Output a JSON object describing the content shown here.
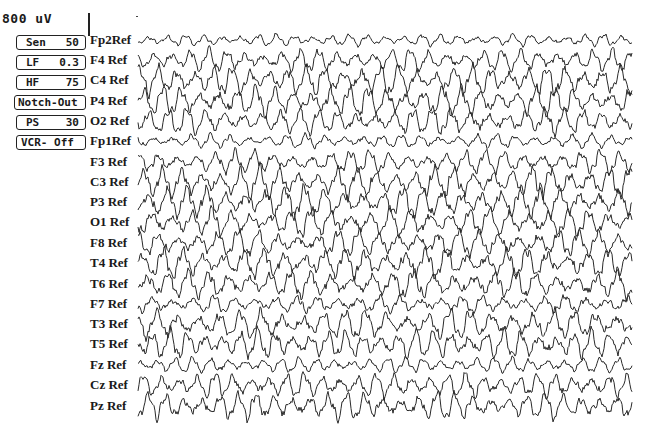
{
  "scale": {
    "label": "800 uV"
  },
  "controls": [
    {
      "id": "sen",
      "name": "Sen",
      "value": "50",
      "top": 35
    },
    {
      "id": "lf",
      "name": "LF",
      "value": "0.3",
      "top": 55
    },
    {
      "id": "hf",
      "name": "HF",
      "value": "75",
      "top": 75
    },
    {
      "id": "notch",
      "name": "Notch-Out",
      "value": "",
      "top": 95
    },
    {
      "id": "ps",
      "name": "PS",
      "value": "30",
      "top": 115
    },
    {
      "id": "vcr",
      "name": "VCR- Off",
      "value": "",
      "top": 135
    }
  ],
  "channels": [
    {
      "label": "Fp2Ref",
      "y": 40,
      "amp": 7,
      "seed": 1
    },
    {
      "label": "F4 Ref",
      "y": 60,
      "amp": 13,
      "seed": 2
    },
    {
      "label": "C4 Ref",
      "y": 80,
      "amp": 17,
      "seed": 3
    },
    {
      "label": "P4 Ref",
      "y": 101,
      "amp": 17,
      "seed": 4
    },
    {
      "label": "O2 Ref",
      "y": 121,
      "amp": 15,
      "seed": 5
    },
    {
      "label": "Fp1Ref",
      "y": 141,
      "amp": 8,
      "seed": 6
    },
    {
      "label": "F3 Ref",
      "y": 162,
      "amp": 13,
      "seed": 7
    },
    {
      "label": "C3 Ref",
      "y": 182,
      "amp": 18,
      "seed": 8
    },
    {
      "label": "P3 Ref",
      "y": 202,
      "amp": 18,
      "seed": 9
    },
    {
      "label": "O1 Ref",
      "y": 222,
      "amp": 16,
      "seed": 10
    },
    {
      "label": "F8 Ref",
      "y": 243,
      "amp": 15,
      "seed": 11
    },
    {
      "label": "T4 Ref",
      "y": 263,
      "amp": 17,
      "seed": 12
    },
    {
      "label": "T6 Ref",
      "y": 284,
      "amp": 16,
      "seed": 13
    },
    {
      "label": "F7 Ref",
      "y": 304,
      "amp": 10,
      "seed": 14
    },
    {
      "label": "T3 Ref",
      "y": 324,
      "amp": 17,
      "seed": 15
    },
    {
      "label": "T5 Ref",
      "y": 344,
      "amp": 17,
      "seed": 16
    },
    {
      "label": "Fz Ref",
      "y": 365,
      "amp": 9,
      "seed": 17
    },
    {
      "label": "Cz Ref",
      "y": 385,
      "amp": 14,
      "seed": 18
    },
    {
      "label": "Pz Ref",
      "y": 406,
      "amp": 16,
      "seed": 19
    }
  ],
  "trace": {
    "x_start": 138,
    "x_end": 632,
    "color": "#2a2a2a"
  }
}
